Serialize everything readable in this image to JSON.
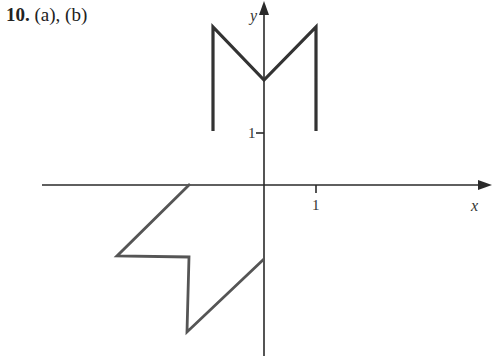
{
  "problem": {
    "number": "10.",
    "parts": "(a), (b)"
  },
  "axes": {
    "x_label": "x",
    "y_label": "y",
    "x_tick_label": "1",
    "y_tick_label": "1",
    "origin_px": [
      264,
      185
    ],
    "unit_px": 52
  },
  "figures": [
    {
      "name": "original-M",
      "points": [
        [
          -1,
          1
        ],
        [
          -1,
          3
        ],
        [
          0,
          2
        ],
        [
          1,
          3
        ],
        [
          1,
          1
        ]
      ]
    },
    {
      "name": "rotated-M-135deg",
      "points": [
        [
          -1.41,
          0
        ],
        [
          -2.83,
          -1.41
        ],
        [
          -1.41,
          -1.41
        ],
        [
          -1.41,
          -2.83
        ],
        [
          0,
          -1.41
        ]
      ]
    }
  ],
  "colors": {
    "axis": "#2a2a2a",
    "figure_a": "#333333",
    "figure_b": "#555555"
  }
}
